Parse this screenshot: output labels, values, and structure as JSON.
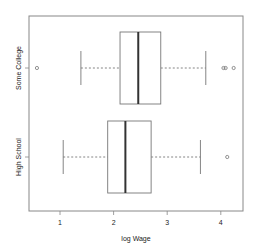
{
  "chart_data": {
    "type": "boxplot",
    "orientation": "horizontal",
    "title": "",
    "xlabel": "log Wage",
    "ylabel": "",
    "xlim": [
      0.45,
      4.45
    ],
    "x_ticks": [
      1,
      2,
      3,
      4
    ],
    "x_tick_labels": [
      "1",
      "2",
      "3",
      "4"
    ],
    "grid": false,
    "categories": [
      "High School",
      "Some College"
    ],
    "series": [
      {
        "name": "High School",
        "whisker_low": 1.06,
        "q1": 1.89,
        "median": 2.22,
        "q3": 2.7,
        "whisker_high": 3.62,
        "outliers": [
          4.12
        ]
      },
      {
        "name": "Some College",
        "whisker_low": 1.39,
        "q1": 2.12,
        "median": 2.46,
        "q3": 2.88,
        "whisker_high": 3.72,
        "outliers": [
          0.57,
          4.05,
          4.09,
          4.24
        ]
      }
    ]
  }
}
